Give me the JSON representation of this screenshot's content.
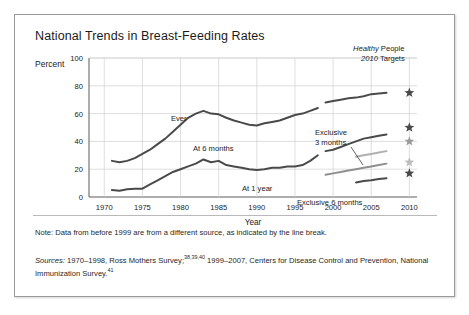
{
  "figure": {
    "title": "National Trends in Breast-Feeding Rates",
    "percent_label": "Percent",
    "note": "Note: Data from before 1999 are from a different source, as indicated by the line break.",
    "sources_prefix": "Sources:",
    "sources_part1": " 1970–1998, Ross Mothers Survey;",
    "sources_sup1": "38,39,40",
    "sources_part2": " 1999–2007, Centers for Disease Control and Prevention, National Immunization Survey.",
    "sources_sup2": "41",
    "target_header_line1_italic": "Healthy",
    "target_header_line1_plain": " People",
    "target_header_line2_italic": "2010",
    "target_header_line2_plain": " Targets"
  },
  "colors": {
    "dark_line": "#4a4a4a",
    "mid_line": "#8f8f8f",
    "light_line": "#b8b8b8",
    "grid": "#d0d0d0",
    "axis": "#5a5a5a",
    "text": "#1b1b1b",
    "frame": "#9a9a9a"
  },
  "chart_data": {
    "type": "line",
    "title": "National Trends in Breast-Feeding Rates",
    "xlabel": "Year",
    "ylabel": "Percent",
    "xlim": [
      1968,
      2011
    ],
    "ylim": [
      0,
      100
    ],
    "xticks": [
      1970,
      1975,
      1980,
      1985,
      1990,
      1995,
      2000,
      2005,
      2010
    ],
    "yticks": [
      0,
      20,
      40,
      60,
      80,
      100
    ],
    "grid": true,
    "legend": "inline-labels",
    "annotations": [
      "Ever",
      "At 6 months",
      "At 1 year",
      "Exclusive 3 months",
      "Exclusive 6 months",
      "Healthy People 2010 Targets"
    ],
    "series": [
      {
        "name": "Ever",
        "label": "Ever",
        "color": "#4a4a4a",
        "segment": "1970-1998",
        "x": [
          1971,
          1972,
          1973,
          1974,
          1975,
          1976,
          1977,
          1978,
          1979,
          1980,
          1981,
          1982,
          1983,
          1984,
          1985,
          1986,
          1987,
          1988,
          1989,
          1990,
          1991,
          1992,
          1993,
          1994,
          1995,
          1996,
          1997,
          1998
        ],
        "values": [
          26,
          25,
          26,
          28,
          31,
          34,
          38,
          42,
          47,
          52,
          57,
          60,
          62,
          60,
          59.5,
          57,
          55,
          53.5,
          52,
          51.5,
          53,
          54,
          55,
          57,
          59,
          60,
          62,
          64
        ]
      },
      {
        "name": "Ever (1999-2007)",
        "label": "Ever",
        "color": "#4a4a4a",
        "segment": "1999-2007",
        "x": [
          1999,
          2000,
          2001,
          2002,
          2003,
          2004,
          2005,
          2006,
          2007
        ],
        "values": [
          68,
          69,
          70,
          71,
          71.5,
          72.5,
          74,
          74.5,
          75
        ]
      },
      {
        "name": "At 6 months",
        "label": "At 6 months",
        "color": "#4a4a4a",
        "segment": "1970-1998",
        "x": [
          1971,
          1972,
          1973,
          1974,
          1975,
          1976,
          1977,
          1978,
          1979,
          1980,
          1981,
          1982,
          1983,
          1984,
          1985,
          1986,
          1987,
          1988,
          1989,
          1990,
          1991,
          1992,
          1993,
          1994,
          1995,
          1996,
          1997,
          1998
        ],
        "values": [
          5,
          4.5,
          5.5,
          6,
          6,
          9,
          12,
          15,
          18,
          20,
          22,
          24,
          27,
          25,
          26,
          23,
          22,
          21,
          20,
          19.5,
          20,
          21,
          21,
          22,
          22,
          23,
          26,
          30
        ]
      },
      {
        "name": "At 6 months (1999-2007)",
        "label": "At 6 months",
        "color": "#4a4a4a",
        "segment": "1999-2007",
        "x": [
          1999,
          2000,
          2001,
          2002,
          2003,
          2004,
          2005,
          2006,
          2007
        ],
        "values": [
          33,
          34,
          36,
          38,
          40,
          42,
          43,
          44,
          45
        ]
      },
      {
        "name": "At 1 year",
        "label": "At 1 year",
        "color": "#8f8f8f",
        "segment": "1999-2007",
        "x": [
          1999,
          2000,
          2001,
          2002,
          2003,
          2004,
          2005,
          2006,
          2007
        ],
        "values": [
          16,
          17,
          18,
          19,
          20,
          21,
          22,
          23,
          24
        ]
      },
      {
        "name": "Exclusive 3 months",
        "label": "Exclusive 3 months",
        "color": "#b0b0b0",
        "segment": "2003-2007",
        "x": [
          2003,
          2004,
          2005,
          2006,
          2007
        ],
        "values": [
          29,
          30,
          31,
          32,
          33
        ]
      },
      {
        "name": "Exclusive 6 months",
        "label": "Exclusive 6 months",
        "color": "#4a4a4a",
        "segment": "2003-2007",
        "x": [
          2003,
          2004,
          2005,
          2006,
          2007
        ],
        "values": [
          10.5,
          11.5,
          12,
          13,
          13.5
        ]
      }
    ],
    "targets": [
      {
        "name": "Ever target",
        "year": 2010,
        "value": 75,
        "color": "#4a4a4a",
        "marker": "star"
      },
      {
        "name": "At 6 months target",
        "year": 2010,
        "value": 50,
        "color": "#4a4a4a",
        "marker": "star"
      },
      {
        "name": "Exclusive 3 months target",
        "year": 2010,
        "value": 40,
        "color": "#9a9a9a",
        "marker": "star"
      },
      {
        "name": "At 1 year target",
        "year": 2010,
        "value": 25,
        "color": "#bdbdbd",
        "marker": "star"
      },
      {
        "name": "Exclusive 6 months target",
        "year": 2010,
        "value": 17,
        "color": "#4a4a4a",
        "marker": "star"
      }
    ]
  }
}
